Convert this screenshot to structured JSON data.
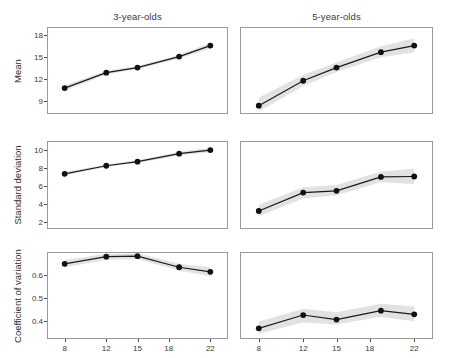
{
  "figure": {
    "xlabel": "Numerosity",
    "panel_titles": [
      "3-year-olds",
      "5-year-olds"
    ],
    "row_labels": [
      "Mean",
      "Standard deviation",
      "Coefficient of variation"
    ],
    "line_color": "#1a1a1a",
    "point_color": "#111111",
    "ribbon_color": "#e2e2e2",
    "panel_border_color": "#9a9a9a"
  },
  "chart_data": {
    "type": "line",
    "title": "",
    "xlabel": "Numerosity",
    "grid": false,
    "legend": "none",
    "x": [
      8,
      12,
      15,
      19,
      22
    ],
    "xticks": [
      8,
      12,
      15,
      18,
      22
    ],
    "xlim": [
      6.4,
      23.6
    ],
    "facets_rows": [
      "Mean",
      "Standard deviation",
      "Coefficient of variation"
    ],
    "facets_cols": [
      "3-year-olds",
      "5-year-olds"
    ],
    "panels": [
      {
        "row": "Mean",
        "col": "3-year-olds",
        "ylabel": "Mean",
        "yticks": [
          9,
          12,
          15,
          18
        ],
        "ylim": [
          7.4,
          19.0
        ],
        "values": [
          10.8,
          12.9,
          13.6,
          15.1,
          16.6
        ],
        "ribbon_lower": [
          10.45,
          12.65,
          13.4,
          14.85,
          16.2
        ],
        "ribbon_upper": [
          11.15,
          13.15,
          13.8,
          15.35,
          17.0
        ]
      },
      {
        "row": "Mean",
        "col": "5-year-olds",
        "ylabel": "Mean",
        "yticks": [
          9,
          12,
          15,
          18
        ],
        "ylim": [
          7.4,
          19.0
        ],
        "values": [
          8.4,
          11.8,
          13.6,
          15.7,
          16.6
        ],
        "ribbon_lower": [
          7.6,
          11.1,
          13.0,
          15.0,
          15.7
        ],
        "ribbon_upper": [
          9.5,
          12.6,
          14.3,
          16.5,
          17.6
        ]
      },
      {
        "row": "Standard deviation",
        "col": "3-year-olds",
        "ylabel": "Standard deviation",
        "yticks": [
          2,
          4,
          6,
          8,
          10
        ],
        "ylim": [
          1.3,
          10.9
        ],
        "values": [
          7.35,
          8.25,
          8.7,
          9.6,
          10.0
        ],
        "ribbon_lower": [
          7.15,
          8.1,
          8.55,
          9.4,
          9.75
        ],
        "ribbon_upper": [
          7.55,
          8.4,
          8.85,
          9.8,
          10.25
        ]
      },
      {
        "row": "Standard deviation",
        "col": "5-year-olds",
        "ylabel": "Standard deviation",
        "yticks": [
          2,
          4,
          6,
          8,
          10
        ],
        "ylim": [
          1.3,
          10.9
        ],
        "values": [
          3.2,
          5.25,
          5.45,
          7.0,
          7.05
        ],
        "ribbon_lower": [
          2.6,
          4.6,
          4.95,
          6.4,
          6.2
        ],
        "ribbon_upper": [
          3.9,
          5.85,
          6.1,
          7.6,
          7.9
        ]
      },
      {
        "row": "Coefficient of variation",
        "col": "3-year-olds",
        "ylabel": "Coefficient of variation",
        "yticks": [
          0.4,
          0.5,
          0.6
        ],
        "ytick_labels": [
          "0.4",
          "0.5",
          "0.6"
        ],
        "ylim": [
          0.325,
          0.695
        ],
        "values": [
          0.648,
          0.679,
          0.681,
          0.633,
          0.613
        ],
        "ribbon_lower": [
          0.632,
          0.666,
          0.668,
          0.619,
          0.594
        ],
        "ribbon_upper": [
          0.665,
          0.692,
          0.694,
          0.648,
          0.633
        ]
      },
      {
        "row": "Coefficient of variation",
        "col": "5-year-olds",
        "ylabel": "Coefficient of variation",
        "yticks": [
          0.4,
          0.5,
          0.6
        ],
        "ytick_labels": [
          "0.4",
          "0.5",
          "0.6"
        ],
        "ylim": [
          0.325,
          0.695
        ],
        "values": [
          0.367,
          0.425,
          0.405,
          0.444,
          0.428
        ],
        "ribbon_lower": [
          0.344,
          0.392,
          0.384,
          0.417,
          0.398
        ],
        "ribbon_upper": [
          0.397,
          0.452,
          0.437,
          0.474,
          0.462
        ]
      }
    ]
  }
}
